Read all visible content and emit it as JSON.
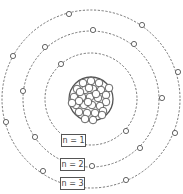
{
  "diagram": {
    "title": "",
    "center": [
      91,
      99
    ],
    "nucleus": {
      "radius": 22,
      "nucleon_count": 31,
      "nucleons": [
        [
          83,
          83
        ],
        [
          91,
          81
        ],
        [
          99,
          83
        ],
        [
          77,
          89
        ],
        [
          85,
          90
        ],
        [
          93,
          89
        ],
        [
          101,
          90
        ],
        [
          106,
          95
        ],
        [
          74,
          97
        ],
        [
          82,
          97
        ],
        [
          90,
          97
        ],
        [
          98,
          98
        ],
        [
          106,
          102
        ],
        [
          76,
          105
        ],
        [
          84,
          105
        ],
        [
          92,
          105
        ],
        [
          100,
          106
        ],
        [
          79,
          112
        ],
        [
          87,
          113
        ],
        [
          95,
          113
        ],
        [
          103,
          111
        ],
        [
          85,
          119
        ],
        [
          93,
          120
        ],
        [
          80,
          92
        ],
        [
          96,
          94
        ],
        [
          88,
          102
        ],
        [
          79,
          101
        ],
        [
          102,
          115
        ],
        [
          72,
          103
        ],
        [
          109,
          88
        ],
        [
          89,
          88
        ]
      ],
      "nucleon_radius": 3.8
    },
    "orbits": [
      {
        "n": 1,
        "label": "n = 1",
        "radius": 46,
        "electrons": [
          [
            61,
            64
          ],
          [
            126,
            131
          ]
        ],
        "label_pos": [
          61,
          134
        ]
      },
      {
        "n": 2,
        "label": "n = 2",
        "radius": 68,
        "electrons": [
          [
            93,
            30
          ],
          [
            134,
            44
          ],
          [
            162,
            98
          ],
          [
            140,
            148
          ],
          [
            92,
            166
          ],
          [
            35,
            137
          ],
          [
            23,
            91
          ],
          [
            45,
            47
          ]
        ],
        "label_pos": [
          60,
          158
        ]
      },
      {
        "n": 3,
        "label": "n = 3",
        "radius": 89,
        "electrons": [
          [
            69,
            14
          ],
          [
            142,
            25
          ],
          [
            178,
            72
          ],
          [
            175,
            133
          ],
          [
            126,
            180
          ],
          [
            43,
            171
          ],
          [
            6,
            122
          ],
          [
            13,
            56
          ]
        ],
        "label_pos": [
          60,
          177
        ]
      }
    ],
    "colors": {
      "stroke": "#555555",
      "orbit": "#666666",
      "background": "#ffffff"
    }
  }
}
